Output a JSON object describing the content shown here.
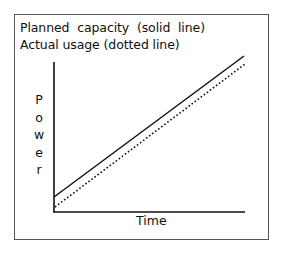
{
  "diagram": {
    "legend": {
      "solid": "Planned  capacity  (solid  line)",
      "dotted": "Actual usage (dotted line)"
    },
    "y_axis_label": "Power",
    "x_axis_label": "Time",
    "series": [
      {
        "name": "Planned capacity",
        "style": "solid",
        "trend": "linear increasing"
      },
      {
        "name": "Actual usage",
        "style": "dotted",
        "trend": "linear increasing, slightly below planned capacity"
      }
    ]
  }
}
